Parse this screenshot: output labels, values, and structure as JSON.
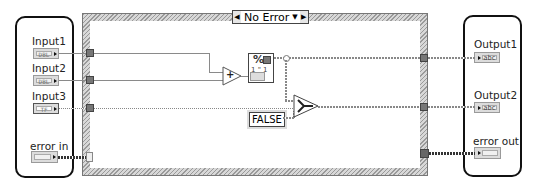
{
  "case_structure": {
    "selector_value": "No Error",
    "prev_label": "◀",
    "next_label": "▶",
    "dropdown_label": "▼"
  },
  "inputs_panel": {
    "items": [
      {
        "label": "Input1",
        "type": "DBL"
      },
      {
        "label": "Input2",
        "type": "DBL"
      },
      {
        "label": "Input3",
        "type": "TF"
      },
      {
        "label": "error in",
        "type": "err"
      }
    ]
  },
  "outputs_panel": {
    "items": [
      {
        "label": "Output1",
        "type": "abc"
      },
      {
        "label": "Output2",
        "type": "abc"
      },
      {
        "label": "error out",
        "type": "err"
      }
    ]
  },
  "nodes": {
    "add": {
      "symbol": "+"
    },
    "format_into_string": {
      "symbol": "%",
      "subtext": "1  \"  1",
      "input_type": "DBL"
    },
    "select": {
      "symbol": "?"
    },
    "false_constant": {
      "label": "FALSE"
    }
  },
  "colors": {
    "wire": "#888888",
    "panel_border": "#111111",
    "frame": "#c8c8c8"
  }
}
